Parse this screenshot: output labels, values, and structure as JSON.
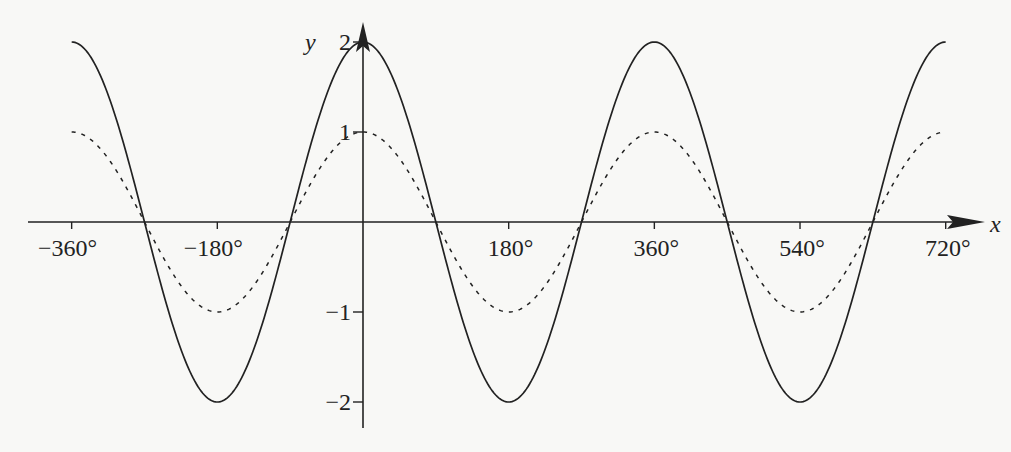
{
  "chart_data": {
    "type": "line",
    "title": "",
    "xlabel": "x",
    "ylabel": "y",
    "xlim": [
      -360,
      720
    ],
    "ylim": [
      -2,
      2
    ],
    "grid": false,
    "legend": null,
    "x_ticks": [
      -360,
      -180,
      180,
      360,
      540,
      720
    ],
    "x_tick_labels": [
      "−360°",
      "−180°",
      "180°",
      "360°",
      "540°",
      "720°"
    ],
    "y_ticks": [
      2,
      1,
      -1,
      -2
    ],
    "y_tick_labels": [
      "2",
      "1",
      "−1",
      "−2"
    ],
    "series": [
      {
        "name": "y = 2cos x",
        "style": "solid",
        "function": "2*cos(x)",
        "x": [
          -360,
          -270,
          -180,
          -90,
          0,
          90,
          180,
          270,
          360,
          450,
          540,
          630,
          720
        ],
        "values": [
          2,
          0,
          -2,
          0,
          2,
          0,
          -2,
          0,
          2,
          0,
          -2,
          0,
          2
        ]
      },
      {
        "name": "y = cos x",
        "style": "dashed",
        "function": "cos(x)",
        "x": [
          -360,
          -270,
          -180,
          -90,
          0,
          90,
          180,
          270,
          360,
          450,
          540,
          630,
          720
        ],
        "values": [
          1,
          0,
          -1,
          0,
          1,
          0,
          -1,
          0,
          1,
          0,
          -1,
          0,
          1
        ]
      }
    ]
  },
  "layout": {
    "x0_px": 363,
    "px_per_deg": 0.8093,
    "y0_px": 222,
    "px_per_unit": 90,
    "color": "#222222"
  }
}
